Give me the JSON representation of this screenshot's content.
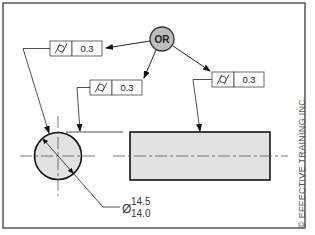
{
  "diagram": {
    "or_node": {
      "label": "OR",
      "fill": "#bdbdbd"
    },
    "feature_control_frames": [
      {
        "id": "fcf-left",
        "symbol": "cylindricity",
        "symbol_glyph": "/○/",
        "tolerance": "0.3"
      },
      {
        "id": "fcf-middle",
        "symbol": "cylindricity",
        "symbol_glyph": "/○/",
        "tolerance": "0.3"
      },
      {
        "id": "fcf-right",
        "symbol": "cylindricity",
        "symbol_glyph": "/○/",
        "tolerance": "0.3"
      }
    ],
    "diameter": {
      "symbol": "Ø",
      "upper": "14.5",
      "lower": "14.0"
    },
    "part_fill": "#e2e2e2",
    "copyright": "© EFFECTIVE TRAINING INC."
  }
}
